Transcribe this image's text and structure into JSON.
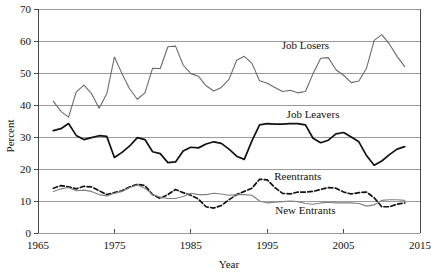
{
  "chart_data": {
    "type": "line",
    "title": "",
    "xlabel": "Year",
    "ylabel": "Percent",
    "xlim": [
      1965,
      2015
    ],
    "ylim": [
      0,
      70
    ],
    "xticks": [
      1965,
      1975,
      1985,
      1995,
      2005,
      2015
    ],
    "yticks": [
      0,
      10,
      20,
      30,
      40,
      50,
      60,
      70
    ],
    "grid": "horizontal",
    "legend_position": "inline-annotations",
    "annotations": [
      {
        "text": "Job Losers",
        "x": 2000,
        "y": 57.5
      },
      {
        "text": "Job Leavers",
        "x": 2001,
        "y": 36.0
      },
      {
        "text": "Reentrants",
        "x": 1999,
        "y": 16.5
      },
      {
        "text": "New Entrants",
        "x": 2000,
        "y": 6.0
      }
    ],
    "x": [
      1967,
      1968,
      1969,
      1970,
      1971,
      1972,
      1973,
      1974,
      1975,
      1976,
      1977,
      1978,
      1979,
      1980,
      1981,
      1982,
      1983,
      1984,
      1985,
      1986,
      1987,
      1988,
      1989,
      1990,
      1991,
      1992,
      1993,
      1994,
      1995,
      1996,
      1997,
      1998,
      1999,
      2000,
      2001,
      2002,
      2003,
      2004,
      2005,
      2006,
      2007,
      2008,
      2009,
      2010,
      2011,
      2012,
      2013
    ],
    "series": [
      {
        "name": "Job Losers",
        "color": "#6b6b6b",
        "style": "solid",
        "values": [
          41.2,
          38.0,
          36.2,
          44.0,
          46.2,
          43.6,
          39.0,
          43.5,
          55.0,
          49.8,
          45.0,
          41.8,
          43.8,
          51.5,
          51.4,
          58.2,
          58.4,
          52.5,
          49.8,
          49.0,
          46.0,
          44.4,
          45.5,
          48.0,
          54.0,
          55.2,
          53.0,
          47.6,
          46.8,
          45.5,
          44.2,
          44.6,
          43.8,
          44.2,
          49.8,
          54.6,
          54.8,
          51.0,
          49.3,
          47.0,
          47.5,
          51.5,
          60.2,
          62.0,
          59.0,
          55.2,
          52.0
        ]
      },
      {
        "name": "Job Leavers",
        "color": "#111111",
        "style": "solid",
        "values": [
          32.0,
          32.6,
          34.2,
          30.5,
          29.2,
          29.8,
          30.4,
          30.2,
          23.6,
          25.2,
          27.2,
          29.8,
          29.2,
          25.4,
          24.8,
          22.0,
          22.2,
          25.6,
          26.8,
          26.6,
          27.8,
          28.5,
          28.0,
          26.2,
          24.0,
          23.0,
          28.8,
          33.8,
          34.2,
          34.0,
          34.0,
          34.2,
          34.2,
          33.8,
          29.6,
          28.2,
          29.0,
          31.0,
          31.4,
          30.0,
          28.5,
          24.2,
          21.2,
          22.5,
          24.5,
          26.2,
          27.0
        ]
      },
      {
        "name": "Reentrants",
        "color": "#111111",
        "style": "dashed",
        "values": [
          14.0,
          14.8,
          14.4,
          13.8,
          14.6,
          14.4,
          13.2,
          12.0,
          12.6,
          13.2,
          14.4,
          15.2,
          14.8,
          12.0,
          10.8,
          12.0,
          13.6,
          12.6,
          11.8,
          10.6,
          8.2,
          7.8,
          8.6,
          10.4,
          12.0,
          13.0,
          14.0,
          16.8,
          16.6,
          14.2,
          12.4,
          12.2,
          12.8,
          12.8,
          13.0,
          13.6,
          14.2,
          14.0,
          12.8,
          12.2,
          12.6,
          12.8,
          11.0,
          8.2,
          8.2,
          9.0,
          9.4
        ]
      },
      {
        "name": "New Entrants",
        "color": "#808080",
        "style": "solid",
        "values": [
          13.0,
          13.8,
          14.2,
          13.2,
          13.4,
          13.0,
          12.0,
          11.6,
          12.4,
          13.0,
          14.2,
          15.0,
          14.0,
          12.0,
          11.2,
          10.8,
          10.8,
          11.4,
          12.4,
          12.0,
          12.0,
          12.4,
          12.2,
          11.8,
          12.0,
          12.0,
          11.8,
          10.0,
          9.4,
          9.6,
          9.8,
          10.0,
          9.8,
          9.2,
          9.0,
          9.4,
          9.6,
          9.4,
          9.4,
          9.4,
          9.2,
          8.4,
          8.8,
          10.2,
          10.4,
          10.4,
          10.2
        ]
      }
    ]
  },
  "axes": {
    "y_axis_title": "Percent",
    "x_axis_title": "Year",
    "y_tick_labels": [
      "0",
      "10",
      "20",
      "30",
      "40",
      "50",
      "60",
      "70"
    ],
    "x_tick_labels": [
      "1965",
      "1975",
      "1985",
      "1995",
      "2005",
      "2015"
    ]
  },
  "labels": {
    "job_losers": "Job Losers",
    "job_leavers": "Job Leavers",
    "reentrants": "Reentrants",
    "new_entrants": "New Entrants"
  },
  "colors": {
    "gridline": "#9a9a9a",
    "axis": "#4a4a4a",
    "job_losers": "#6b6b6b",
    "job_leavers": "#111111",
    "reentrants": "#111111",
    "new_entrants": "#808080",
    "background": "#ffffff"
  }
}
